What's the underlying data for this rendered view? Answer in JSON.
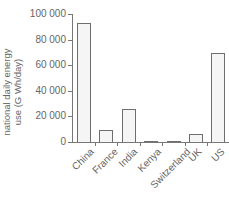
{
  "chart_data": {
    "type": "bar",
    "title": "",
    "xlabel": "",
    "ylabel": "national daily energy use (G Wh/day)",
    "ylabel_lines": [
      "national daily energy",
      "use (G Wh/day)"
    ],
    "categories": [
      "China",
      "France",
      "India",
      "Kenya",
      "Switzerland",
      "UK",
      "US"
    ],
    "values": [
      93000,
      9000,
      26000,
      1000,
      1000,
      6000,
      69500
    ],
    "ylim": [
      0,
      100000
    ],
    "yticks": [
      0,
      20000,
      40000,
      60000,
      80000,
      100000
    ],
    "ytick_labels": [
      "0",
      "20 000",
      "40 000",
      "60 000",
      "80 000",
      "100 000"
    ],
    "grid": false,
    "legend": null
  },
  "colors": {
    "bar_fill": "#f5f5f5",
    "bar_edge": "#6e6e6e",
    "axis": "#777777",
    "text": "#666666"
  }
}
